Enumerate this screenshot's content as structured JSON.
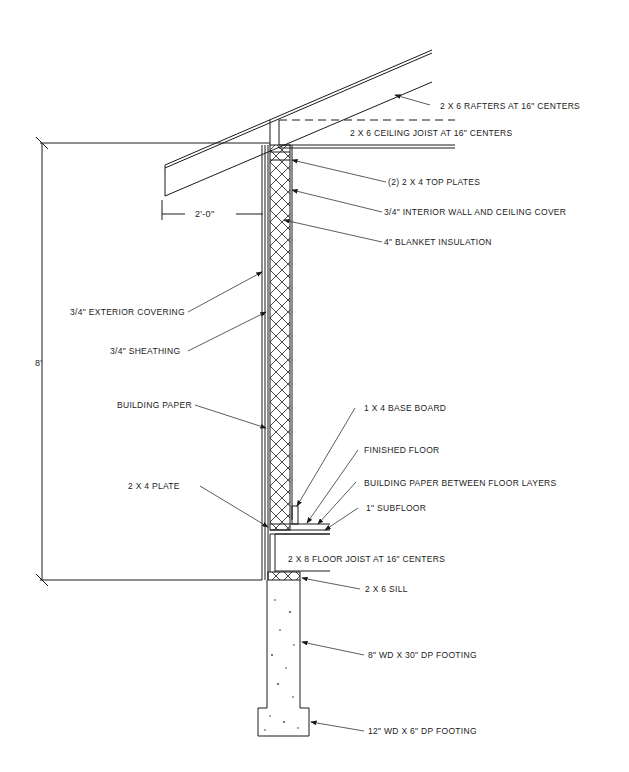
{
  "diagram": {
    "type": "wall-section-detail",
    "dimensions": {
      "wall_height": "8'",
      "overhang": "2'-0\""
    },
    "labels": {
      "rafters": "2 X 6 RAFTERS AT 16\" CENTERS",
      "ceiling_joist": "2 X 6 CEILING JOIST AT 16\" CENTERS",
      "top_plates": "(2) 2 X 4 TOP PLATES",
      "interior_cover": "3/4\" INTERIOR WALL AND CEILING COVER",
      "insulation": "4\" BLANKET INSULATION",
      "exterior_covering": "3/4\" EXTERIOR COVERING",
      "sheathing": "3/4\" SHEATHING",
      "building_paper": "BUILDING PAPER",
      "base_board": "1 X 4 BASE BOARD",
      "finished_floor": "FINISHED FLOOR",
      "floor_paper": "BUILDING PAPER BETWEEN FLOOR LAYERS",
      "subfloor": "1\" SUBFLOOR",
      "bottom_plate": "2 X 4 PLATE",
      "floor_joist": "2 X 8 FLOOR JOIST AT 16\" CENTERS",
      "sill": "2 X 6 SILL",
      "foundation_wall": "8\" WD X 30\" DP FOOTING",
      "footing": "12\" WD X 6\" DP FOOTING"
    }
  }
}
